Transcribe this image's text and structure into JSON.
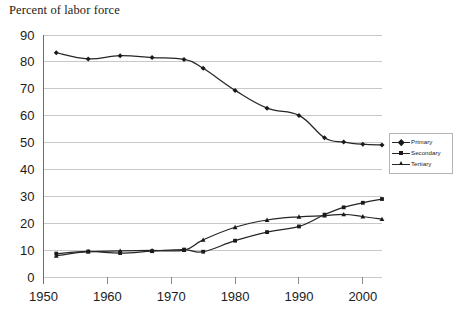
{
  "chart_data": {
    "type": "line",
    "title": "Percent of labor force",
    "xlabel": "",
    "ylabel": "",
    "xlim": [
      1950,
      2003
    ],
    "ylim": [
      0,
      90
    ],
    "ytick_step": 10,
    "grid": true,
    "legend_position": "right",
    "xticks": [
      1950,
      1960,
      1970,
      1980,
      1990,
      2000
    ],
    "xtick_labels": [
      "1950",
      "1960",
      "1970",
      "1980",
      "1990",
      "2000"
    ],
    "yticks": [
      0,
      10,
      20,
      30,
      40,
      50,
      60,
      70,
      80,
      90
    ],
    "ytick_labels": [
      "0",
      "10",
      "20",
      "30",
      "40",
      "50",
      "60",
      "70",
      "80",
      "90"
    ],
    "x": [
      1952,
      1957,
      1962,
      1967,
      1972,
      1975,
      1980,
      1985,
      1990,
      1994,
      1997,
      2000,
      2003
    ],
    "series": [
      {
        "name": "Primary",
        "marker": "diamond",
        "values": [
          83.4,
          81.1,
          82.3,
          81.6,
          80.9,
          77.6,
          69.4,
          62.8,
          60.1,
          51.8,
          50.2,
          49.4,
          49.1
        ]
      },
      {
        "name": "Secondary",
        "marker": "square",
        "values": [
          8.7,
          9.5,
          8.9,
          9.6,
          10.2,
          9.4,
          13.5,
          16.7,
          18.8,
          23.2,
          25.9,
          27.6,
          29.0
        ]
      },
      {
        "name": "Tertiary",
        "marker": "triangle",
        "values": [
          7.9,
          9.4,
          9.7,
          9.9,
          10.0,
          13.8,
          18.5,
          21.2,
          22.4,
          22.8,
          23.3,
          22.5,
          21.5
        ]
      }
    ]
  },
  "legend": {
    "items": [
      {
        "label": "Primary"
      },
      {
        "label": "Secondary"
      },
      {
        "label": "Tertiary"
      }
    ]
  }
}
